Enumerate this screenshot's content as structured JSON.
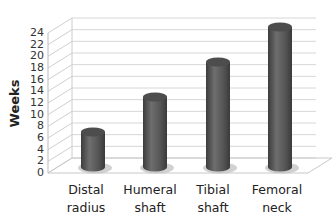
{
  "chart_data": {
    "type": "bar",
    "style": "3d-cylinder",
    "title": "",
    "xlabel": "",
    "ylabel": "Weeks",
    "ylim": [
      0,
      24
    ],
    "yticks": [
      0,
      2,
      4,
      6,
      8,
      10,
      12,
      14,
      16,
      18,
      20,
      22,
      24
    ],
    "grid": true,
    "legend": null,
    "categories": [
      "Distal radius",
      "Humeral shaft",
      "Tibial shaft",
      "Femoral neck"
    ],
    "category_lines": [
      [
        "Distal",
        "radius"
      ],
      [
        "Humeral",
        "shaft"
      ],
      [
        "Tibial",
        "shaft"
      ],
      [
        "Femoral",
        "neck"
      ]
    ],
    "values": [
      6,
      12,
      18,
      24
    ],
    "bar_color": "#5a5a5a"
  },
  "labels": {
    "ytick_0": "0",
    "ytick_2": "2",
    "ytick_4": "4",
    "ytick_6": "6",
    "ytick_8": "8",
    "ytick_10": "10",
    "ytick_12": "12",
    "ytick_14": "14",
    "ytick_16": "16",
    "ytick_18": "18",
    "ytick_20": "20",
    "ytick_22": "22",
    "ytick_24": "24"
  }
}
